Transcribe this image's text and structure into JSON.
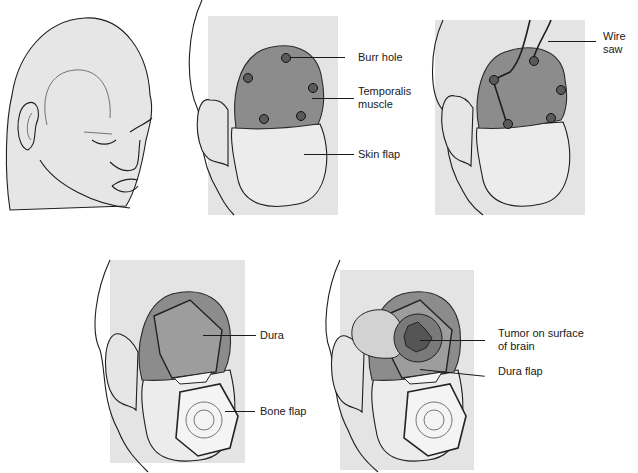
{
  "figure": {
    "panels": [
      {
        "id": "panel-1",
        "description": "Head with incision line",
        "labels": []
      },
      {
        "id": "panel-2",
        "description": "Skin flap retracted with burr holes",
        "labels": [
          {
            "key": "burr_hole",
            "text": "Burr hole"
          },
          {
            "key": "temporalis_muscle",
            "text": "Temporalis\nmuscle"
          },
          {
            "key": "skin_flap",
            "text": "Skin flap"
          }
        ]
      },
      {
        "id": "panel-3",
        "description": "Wire saw between burr holes",
        "labels": [
          {
            "key": "wire_saw",
            "text": "Wire\nsaw"
          }
        ]
      },
      {
        "id": "panel-4",
        "description": "Bone flap removed exposing dura",
        "labels": [
          {
            "key": "dura",
            "text": "Dura"
          },
          {
            "key": "bone_flap",
            "text": "Bone flap"
          }
        ]
      },
      {
        "id": "panel-5",
        "description": "Dura flap opened exposing tumor",
        "labels": [
          {
            "key": "tumor",
            "text": "Tumor on surface\nof brain"
          },
          {
            "key": "dura_flap",
            "text": "Dura flap"
          }
        ]
      }
    ]
  },
  "colors": {
    "background": "#ffffff",
    "panel_bg": "#e4e4e4",
    "muscle": "#8c8c8c",
    "line": "#1e1e1e"
  }
}
